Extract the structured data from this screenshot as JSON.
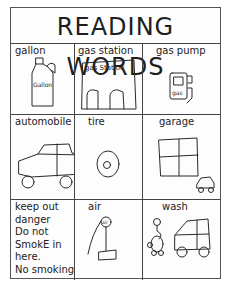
{
  "chart": {
    "title": "READING WORDS",
    "cells": [
      {
        "label": "gallon",
        "drawing": "gallon-jug-icon",
        "drawing_text": "Gallon"
      },
      {
        "label": "gas station",
        "drawing": "gas-station-icon",
        "drawing_text": "gas Station"
      },
      {
        "label": "gas pump",
        "drawing": "gas-pump-icon",
        "drawing_text": "gas"
      },
      {
        "label": "automobile",
        "drawing": "car-icon"
      },
      {
        "label": "tire",
        "drawing": "tire-icon"
      },
      {
        "label": "garage",
        "drawing": "garage-icon"
      },
      {
        "label": "keep out danger Do not SmokE in here. No smoking",
        "lines": [
          "keep out",
          "danger",
          "Do not",
          "SmokE in",
          "here.",
          "No smoking"
        ],
        "drawing": null
      },
      {
        "label": "air",
        "drawing": "air-pump-icon",
        "drawing_text": "air"
      },
      {
        "label": "wash",
        "drawing": "car-wash-icon"
      }
    ]
  }
}
